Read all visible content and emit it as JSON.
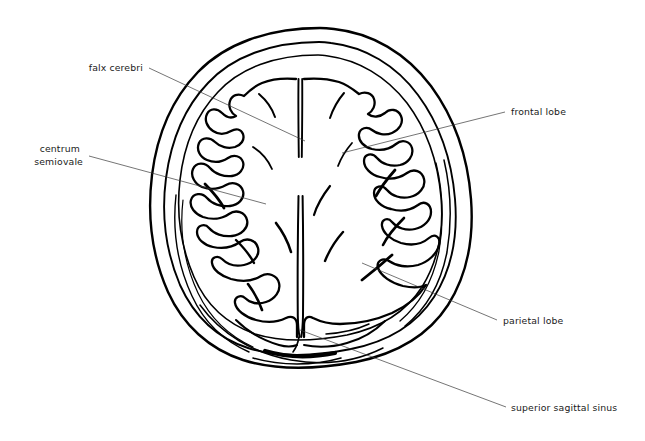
{
  "figure": {
    "background_color": "#ffffff",
    "ink_color": "#000000",
    "leader_color": "#3a3a3a",
    "width": 645,
    "height": 441
  },
  "labels": [
    {
      "id": "falx-cerebri",
      "text": "falx cerebri",
      "lines": [
        "falx cerebri"
      ],
      "anchor": "end",
      "text_x": 143,
      "text_y": 71,
      "leader": {
        "x1": 149,
        "y1": 68,
        "x2": 305,
        "y2": 141
      }
    },
    {
      "id": "centrum-semiovale",
      "text": "centrum semiovale",
      "lines": [
        "centrum",
        "semiovale"
      ],
      "anchor": "end",
      "text_x": 83,
      "text_y": 152,
      "leader": {
        "x1": 89,
        "y1": 156,
        "x2": 266,
        "y2": 204
      }
    },
    {
      "id": "frontal-lobe",
      "text": "frontal lobe",
      "lines": [
        "frontal lobe"
      ],
      "anchor": "start",
      "text_x": 511,
      "text_y": 115,
      "leader": {
        "x1": 342,
        "y1": 153,
        "x2": 505,
        "y2": 112
      }
    },
    {
      "id": "parietal-lobe",
      "text": "parietal lobe",
      "lines": [
        "parietal lobe"
      ],
      "anchor": "start",
      "text_x": 503,
      "text_y": 324,
      "leader": {
        "x1": 362,
        "y1": 263,
        "x2": 497,
        "y2": 320
      }
    },
    {
      "id": "superior-sagittal-sinus",
      "text": "superior sagittal sinus",
      "lines": [
        "superior sagittal sinus"
      ],
      "anchor": "start",
      "text_x": 511,
      "text_y": 411,
      "leader": {
        "x1": 300,
        "y1": 330,
        "x2": 506,
        "y2": 407
      }
    }
  ],
  "structures": [
    {
      "id": "skull-outer-table",
      "name": "outer table of skull"
    },
    {
      "id": "skull-inner-table",
      "name": "inner table of skull"
    },
    {
      "id": "dura-mater",
      "name": "dura mater"
    },
    {
      "id": "left-hemisphere",
      "name": "left cerebral hemisphere"
    },
    {
      "id": "right-hemisphere",
      "name": "right cerebral hemisphere"
    },
    {
      "id": "falx-cerebri-structure",
      "name": "falx cerebri"
    },
    {
      "id": "superior-sagittal-sinus-structure",
      "name": "superior sagittal sinus"
    }
  ]
}
